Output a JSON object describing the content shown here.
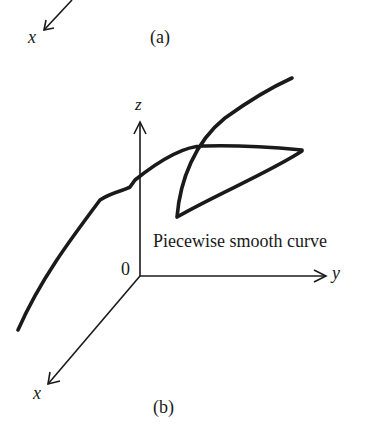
{
  "figure_a": {
    "caption": "(a)",
    "x_axis_label": "x"
  },
  "figure_b": {
    "caption": "(b)",
    "x_axis_label": "x",
    "y_axis_label": "y",
    "z_axis_label": "z",
    "origin_label": "0",
    "curve_label": "Piecewise smooth curve"
  }
}
